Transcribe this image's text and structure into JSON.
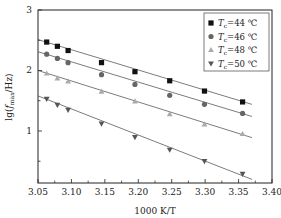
{
  "chart_data": {
    "type": "scatter",
    "title": "",
    "xlabel": "1000 K/T",
    "ylabel": "lg(f_max/Hz)",
    "xlim": [
      3.05,
      3.4
    ],
    "ylim": [
      0.14,
      3.0
    ],
    "xticks": [
      "3.05",
      "3.10",
      "3.15",
      "3.20",
      "3.25",
      "3.30",
      "3.35",
      "3.40"
    ],
    "yticks": [
      "1",
      "2",
      "3"
    ],
    "grid": false,
    "legend_position": "upper right",
    "fit_lines": true,
    "x": [
      3.063,
      3.079,
      3.095,
      3.145,
      3.195,
      3.247,
      3.299,
      3.356
    ],
    "series": [
      {
        "name": "Tc=44 ℃",
        "marker": "square",
        "color": "#111111",
        "values": [
          2.47,
          2.4,
          2.33,
          2.13,
          1.98,
          1.83,
          1.66,
          1.48
        ],
        "fit": [
          [
            3.05,
            2.51
          ],
          [
            3.37,
            1.44
          ]
        ]
      },
      {
        "name": "Tc=46 ℃",
        "marker": "circle",
        "color": "#666666",
        "values": [
          2.27,
          2.2,
          2.13,
          1.93,
          1.77,
          1.59,
          1.44,
          1.29
        ],
        "fit": [
          [
            3.05,
            2.31
          ],
          [
            3.37,
            1.24
          ]
        ]
      },
      {
        "name": "Tc=48 ℃",
        "marker": "triangle-up",
        "color": "#aaaaaa",
        "values": [
          1.95,
          1.87,
          1.82,
          1.65,
          1.49,
          1.28,
          1.11,
          0.95
        ],
        "fit": [
          [
            3.05,
            2.0
          ],
          [
            3.37,
            0.89
          ]
        ]
      },
      {
        "name": "Tc=50 ℃",
        "marker": "triangle-down",
        "color": "#555555",
        "values": [
          1.53,
          1.43,
          1.35,
          1.12,
          0.9,
          0.69,
          0.5,
          0.29
        ],
        "fit": [
          [
            3.05,
            1.58
          ],
          [
            3.37,
            0.2
          ]
        ]
      }
    ]
  },
  "axis": {
    "xlabel": "1000 K/T",
    "ylabel_prefix": "lg(",
    "ylabel_f": "f",
    "ylabel_sub": "max",
    "ylabel_suffix": "/Hz)"
  },
  "legend": [
    {
      "T": "T",
      "sub": "c",
      "text": "=44 ℃"
    },
    {
      "T": "T",
      "sub": "c",
      "text": "=46 ℃"
    },
    {
      "T": "T",
      "sub": "c",
      "text": "=48 ℃"
    },
    {
      "T": "T",
      "sub": "c",
      "text": "=50 ℃"
    }
  ]
}
